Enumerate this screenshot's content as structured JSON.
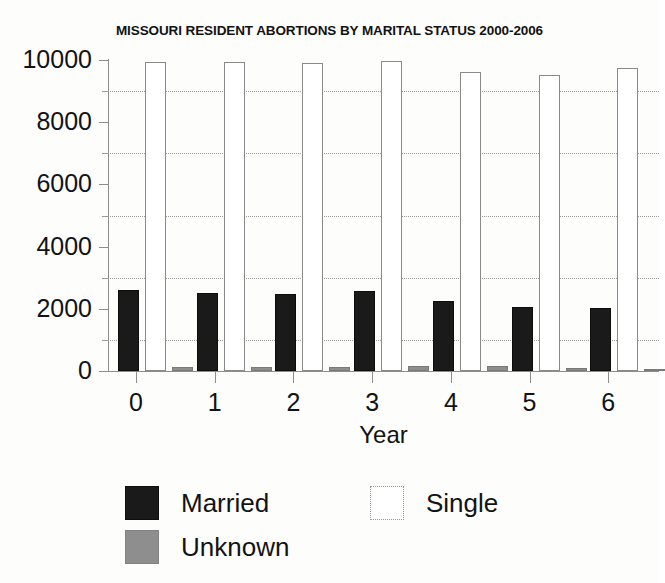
{
  "chart_data": {
    "type": "bar",
    "title": "MISSOURI RESIDENT ABORTIONS BY MARITAL STATUS 2000-2006",
    "xlabel": "Year",
    "ylabel": "",
    "categories": [
      "0",
      "1",
      "2",
      "3",
      "4",
      "5",
      "6"
    ],
    "ylim": [
      0,
      10000
    ],
    "ytick_labels": [
      "0",
      "2000",
      "4000",
      "6000",
      "8000",
      "10000"
    ],
    "ytick_values": [
      0,
      2000,
      4000,
      6000,
      8000,
      10000
    ],
    "yminor_values": [
      1000,
      3000,
      5000,
      7000,
      9000
    ],
    "grid": "horizontal dotted gridlines at 1000, 3000, 5000, 7000, 9000",
    "legend_position": "bottom",
    "series": [
      {
        "name": "Married",
        "color": "#1a1a1a",
        "values": [
          2600,
          2500,
          2475,
          2575,
          2250,
          2060,
          2025
        ]
      },
      {
        "name": "Single",
        "color": "#ffffff",
        "values": [
          9930,
          9930,
          9900,
          9970,
          9610,
          9520,
          9740
        ]
      },
      {
        "name": "Unknown",
        "color": "#8e8e8e",
        "values": [
          130,
          120,
          130,
          160,
          170,
          110,
          70
        ]
      }
    ]
  },
  "legend": {
    "entries": [
      {
        "label": "Married",
        "swatch": "married-swatch"
      },
      {
        "label": "Single",
        "swatch": "single-swatch"
      },
      {
        "label": "Unknown",
        "swatch": "unknown-swatch"
      }
    ]
  }
}
